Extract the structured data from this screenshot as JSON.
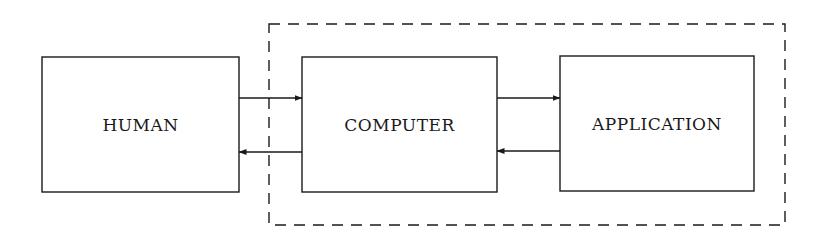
{
  "diagram": {
    "type": "block-diagram",
    "nodes": [
      {
        "id": "human",
        "label": "HUMAN"
      },
      {
        "id": "computer",
        "label": "COMPUTER"
      },
      {
        "id": "application",
        "label": "APPLICATION"
      }
    ],
    "edges": [
      {
        "from": "human",
        "to": "computer"
      },
      {
        "from": "computer",
        "to": "human"
      },
      {
        "from": "computer",
        "to": "application"
      },
      {
        "from": "application",
        "to": "computer"
      }
    ],
    "groups": [
      {
        "id": "system-boundary",
        "style": "dashed",
        "contains": [
          "computer",
          "application"
        ]
      }
    ]
  },
  "colors": {
    "line": "#1a1a1a",
    "background": "#ffffff"
  }
}
